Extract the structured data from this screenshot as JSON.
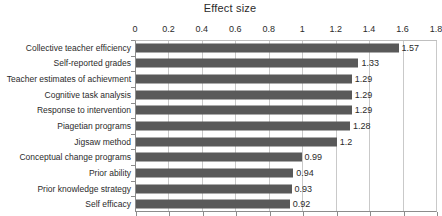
{
  "chart_data": {
    "type": "bar",
    "orientation": "horizontal",
    "title": "Effect size",
    "xlabel": "",
    "ylabel": "",
    "xlim": [
      0,
      1.8
    ],
    "xticks": [
      "0",
      "0.2",
      "0.4",
      "0.6",
      "0.8",
      "1",
      "1.2",
      "1.4",
      "1.6",
      "1.8"
    ],
    "xtick_values": [
      0,
      0.2,
      0.4,
      0.6,
      0.8,
      1,
      1.2,
      1.4,
      1.6,
      1.8
    ],
    "grid": "vertical",
    "legend": "none",
    "bar_color": "#595959",
    "categories": [
      "Collective teacher efficiency",
      "Self-reported grades",
      "Teacher estimates of achievment",
      "Cognitive task analysis",
      "Response to intervention",
      "Piagetian programs",
      "Jigsaw method",
      "Conceptual change programs",
      "Prior ability",
      "Prior knowledge strategy",
      "Self efficacy"
    ],
    "values": [
      1.57,
      1.33,
      1.29,
      1.29,
      1.29,
      1.28,
      1.2,
      0.99,
      0.94,
      0.93,
      0.92
    ],
    "data_labels": [
      "1.57",
      "1.33",
      "1.29",
      "1.29",
      "1.29",
      "1.28",
      "1.2",
      "0.99",
      "0.94",
      "0.93",
      "0.92"
    ]
  }
}
